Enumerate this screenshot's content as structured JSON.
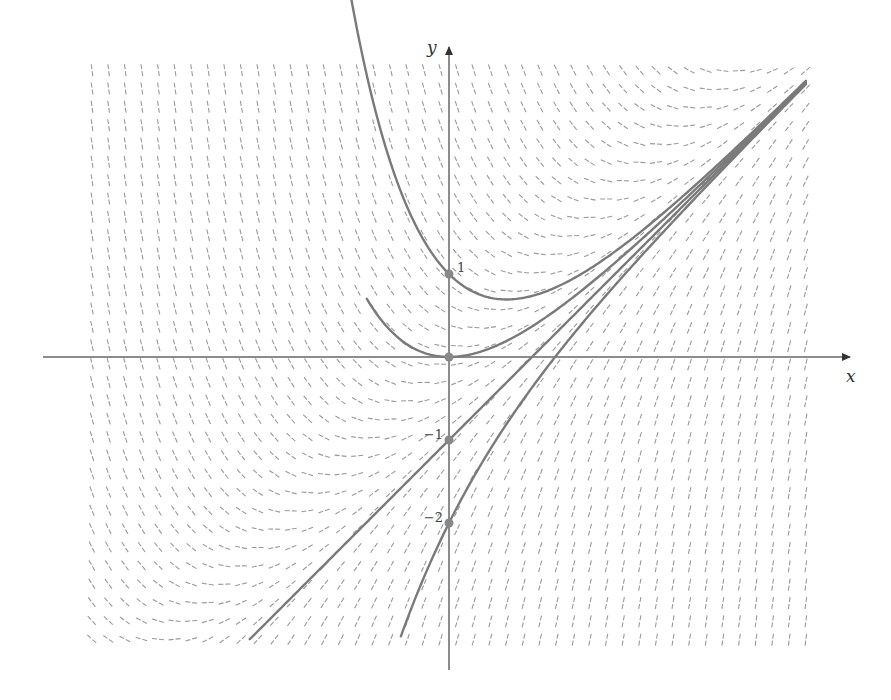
{
  "chart_data": {
    "type": "line",
    "title": "",
    "subtitle": "Slope field of dy/dx = x − y with solution curves y = x − 1 + C·e^(−x)",
    "xlabel": "x",
    "ylabel": "y",
    "xlim": [
      -4.9,
      4.9
    ],
    "ylim": [
      -3.8,
      3.7
    ],
    "grid": false,
    "legend": null,
    "slope_field": {
      "equation": "dy/dx = x - y",
      "x_range": [
        -4.3,
        4.3
      ],
      "y_range": [
        -3.4,
        3.45
      ],
      "columns": 44,
      "rows": 32,
      "color": "#9a9a9a",
      "dashed": true
    },
    "series": [
      {
        "name": "C = 2 (through (0,1))",
        "initial_point": [
          0,
          1
        ],
        "C": 2,
        "x_range": [
          -1.77,
          4.3
        ],
        "min_point": [
          0.69,
          0.69
        ]
      },
      {
        "name": "C = 1 (through (0,0))",
        "initial_point": [
          0,
          0
        ],
        "C": 1,
        "x_range": [
          -0.99,
          4.3
        ],
        "min_point": [
          0,
          0
        ]
      },
      {
        "name": "C = 0 (through (0,-1))",
        "initial_point": [
          0,
          -1
        ],
        "C": 0,
        "x_range": [
          -2.4,
          4.3
        ]
      },
      {
        "name": "C = -1 (through (0,-2))",
        "initial_point": [
          0,
          -2
        ],
        "C": -1,
        "x_range": [
          -0.58,
          4.3
        ]
      }
    ],
    "marked_points": [
      [
        0,
        1
      ],
      [
        0,
        0
      ],
      [
        0,
        -1
      ],
      [
        0,
        -2
      ]
    ],
    "tick_labels": {
      "y": [
        {
          "value": 1,
          "label": "1"
        },
        {
          "value": -1,
          "label": "−1"
        },
        {
          "value": -2,
          "label": "−2"
        }
      ]
    },
    "annotations": []
  },
  "axes": {
    "x_label": "x",
    "y_label": "y",
    "color": "#666666",
    "curve_color": "#7a7a7a",
    "point_color": "#888888"
  },
  "layout": {
    "origin_px": [
      449,
      357
    ],
    "unit_px": 83,
    "x_axis_px": [
      43,
      850
    ],
    "y_axis_px": [
      47,
      670
    ]
  }
}
